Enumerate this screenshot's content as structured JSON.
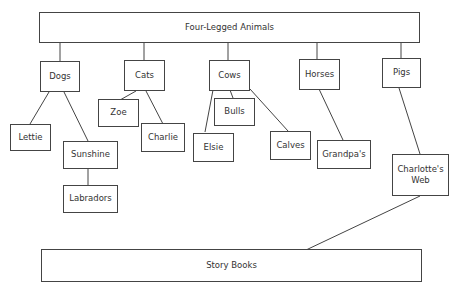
{
  "diagram": {
    "root": "Four-Legged Animals",
    "categories": [
      "Dogs",
      "Cats",
      "Cows",
      "Horses",
      "Pigs"
    ],
    "leaves": {
      "lettie": "Lettie",
      "sunshine": "Sunshine",
      "labradors": "Labradors",
      "zoe": "Zoe",
      "charlie": "Charlie",
      "bulls": "Bulls",
      "elsie": "Elsie",
      "calves": "Calves",
      "grandpas": "Grandpa's",
      "charlottes_web": "Charlotte's Web"
    },
    "bottom": "Story Books",
    "edges": [
      [
        "Four-Legged Animals",
        "Dogs"
      ],
      [
        "Four-Legged Animals",
        "Cats"
      ],
      [
        "Four-Legged Animals",
        "Cows"
      ],
      [
        "Four-Legged Animals",
        "Horses"
      ],
      [
        "Four-Legged Animals",
        "Pigs"
      ],
      [
        "Dogs",
        "Lettie"
      ],
      [
        "Dogs",
        "Sunshine"
      ],
      [
        "Sunshine",
        "Labradors"
      ],
      [
        "Cats",
        "Zoe"
      ],
      [
        "Cats",
        "Charlie"
      ],
      [
        "Cows",
        "Bulls"
      ],
      [
        "Cows",
        "Elsie"
      ],
      [
        "Cows",
        "Calves"
      ],
      [
        "Horses",
        "Grandpa's"
      ],
      [
        "Pigs",
        "Charlotte's Web"
      ],
      [
        "Charlotte's Web",
        "Story Books"
      ]
    ]
  }
}
